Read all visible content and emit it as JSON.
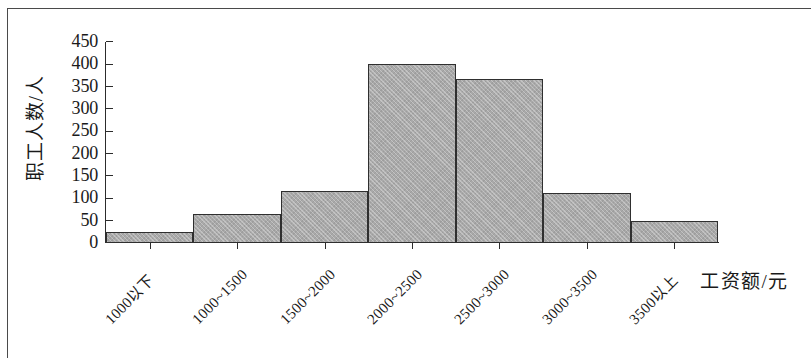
{
  "chart_data": {
    "type": "bar",
    "title": "",
    "subtitle": "",
    "xlabel": "工资额/元",
    "ylabel": "职工人数/人",
    "categories": [
      "1000以下",
      "1000~1500",
      "1500~2000",
      "2000~2500",
      "2500~3000",
      "3000~3500",
      "3500以上"
    ],
    "values": [
      25,
      65,
      117,
      400,
      367,
      112,
      50
    ],
    "series": [
      {
        "name": "职工人数",
        "values": [
          25,
          65,
          117,
          400,
          367,
          112,
          50
        ]
      }
    ],
    "ylim": [
      0,
      450
    ],
    "ytick_step": 50,
    "yticks": [
      "450",
      "400",
      "350",
      "300",
      "250",
      "200",
      "150",
      "100",
      "50",
      "0"
    ],
    "ytick_values": [
      450,
      400,
      350,
      300,
      250,
      200,
      150,
      100,
      50,
      0
    ],
    "grid": false,
    "legend": false,
    "legend_position": "none",
    "bar_fill_color": "#a9a9a9",
    "bar_border_color": "#2f2f2f",
    "axis_color": "#2c2c2c",
    "background_color": "#ffffff",
    "annotations": []
  }
}
